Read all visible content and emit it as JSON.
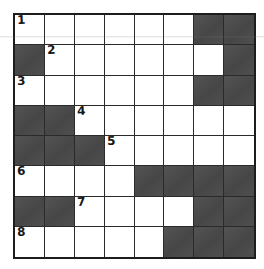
{
  "puzzle": {
    "type": "crossword-grid",
    "title": "Crossword Puzzle Grid",
    "rows": 8,
    "columns": 8,
    "colors": {
      "block_fill": "#4a4a4a",
      "open_fill": "#ffffff",
      "grid_line": "#2a2a2a",
      "outer_border": "#1d1d1d",
      "number_text": "#161616",
      "page_background": "#ffffff"
    },
    "clue_numbers": [
      "1",
      "2",
      "3",
      "4",
      "5",
      "6",
      "7",
      "8"
    ],
    "grid": [
      [
        {
          "state": "open",
          "number": "1"
        },
        {
          "state": "open",
          "number": ""
        },
        {
          "state": "open",
          "number": ""
        },
        {
          "state": "open",
          "number": ""
        },
        {
          "state": "open",
          "number": ""
        },
        {
          "state": "open",
          "number": ""
        },
        {
          "state": "block",
          "number": ""
        },
        {
          "state": "block",
          "number": ""
        }
      ],
      [
        {
          "state": "block",
          "number": ""
        },
        {
          "state": "open",
          "number": "2"
        },
        {
          "state": "open",
          "number": ""
        },
        {
          "state": "open",
          "number": ""
        },
        {
          "state": "open",
          "number": ""
        },
        {
          "state": "open",
          "number": ""
        },
        {
          "state": "open",
          "number": ""
        },
        {
          "state": "block",
          "number": ""
        }
      ],
      [
        {
          "state": "open",
          "number": "3"
        },
        {
          "state": "open",
          "number": ""
        },
        {
          "state": "open",
          "number": ""
        },
        {
          "state": "open",
          "number": ""
        },
        {
          "state": "open",
          "number": ""
        },
        {
          "state": "open",
          "number": ""
        },
        {
          "state": "block",
          "number": ""
        },
        {
          "state": "block",
          "number": ""
        }
      ],
      [
        {
          "state": "block",
          "number": ""
        },
        {
          "state": "block",
          "number": ""
        },
        {
          "state": "open",
          "number": "4"
        },
        {
          "state": "open",
          "number": ""
        },
        {
          "state": "open",
          "number": ""
        },
        {
          "state": "open",
          "number": ""
        },
        {
          "state": "open",
          "number": ""
        },
        {
          "state": "open",
          "number": ""
        }
      ],
      [
        {
          "state": "block",
          "number": ""
        },
        {
          "state": "block",
          "number": ""
        },
        {
          "state": "block",
          "number": ""
        },
        {
          "state": "open",
          "number": "5"
        },
        {
          "state": "open",
          "number": ""
        },
        {
          "state": "open",
          "number": ""
        },
        {
          "state": "open",
          "number": ""
        },
        {
          "state": "open",
          "number": ""
        }
      ],
      [
        {
          "state": "open",
          "number": "6"
        },
        {
          "state": "open",
          "number": ""
        },
        {
          "state": "open",
          "number": ""
        },
        {
          "state": "open",
          "number": ""
        },
        {
          "state": "block",
          "number": ""
        },
        {
          "state": "block",
          "number": ""
        },
        {
          "state": "block",
          "number": ""
        },
        {
          "state": "block",
          "number": ""
        }
      ],
      [
        {
          "state": "block",
          "number": ""
        },
        {
          "state": "block",
          "number": ""
        },
        {
          "state": "open",
          "number": "7"
        },
        {
          "state": "open",
          "number": ""
        },
        {
          "state": "open",
          "number": ""
        },
        {
          "state": "open",
          "number": ""
        },
        {
          "state": "block",
          "number": ""
        },
        {
          "state": "block",
          "number": ""
        }
      ],
      [
        {
          "state": "open",
          "number": "8"
        },
        {
          "state": "open",
          "number": ""
        },
        {
          "state": "open",
          "number": ""
        },
        {
          "state": "open",
          "number": ""
        },
        {
          "state": "open",
          "number": ""
        },
        {
          "state": "block",
          "number": ""
        },
        {
          "state": "block",
          "number": ""
        },
        {
          "state": "block",
          "number": ""
        }
      ]
    ]
  }
}
